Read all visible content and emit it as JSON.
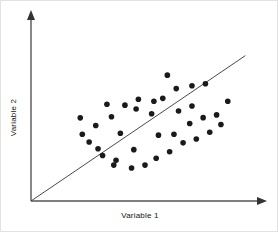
{
  "chart_data": {
    "type": "scatter",
    "title": "",
    "subtitle": "",
    "xlabel": "Variable 1",
    "ylabel": "Variable 2",
    "xlim": [
      0,
      100
    ],
    "ylim": [
      0,
      100
    ],
    "grid": false,
    "legend": null,
    "legend_position": "none",
    "axis_style": "arrow-axes-no-ticks",
    "tick_labels_x": [],
    "tick_labels_y": [],
    "annotations": [],
    "marker": {
      "shape": "circle",
      "color": "#1a1a1a",
      "radius_px": 2.8
    },
    "axis_color": "#555555",
    "trendline": {
      "label": "",
      "color": "#4a4a4a",
      "style": "solid",
      "x": [
        0,
        94
      ],
      "y": [
        0,
        79
      ]
    },
    "points": [
      {
        "x": 21.6,
        "y": 45.2
      },
      {
        "x": 28.4,
        "y": 41.0
      },
      {
        "x": 35.3,
        "y": 45.8
      },
      {
        "x": 25.5,
        "y": 32.1
      },
      {
        "x": 31.4,
        "y": 24.7
      },
      {
        "x": 37.3,
        "y": 22.1
      },
      {
        "x": 45.1,
        "y": 27.9
      },
      {
        "x": 50.0,
        "y": 19.5
      },
      {
        "x": 39.2,
        "y": 36.8
      },
      {
        "x": 46.1,
        "y": 50.0
      },
      {
        "x": 52.9,
        "y": 47.4
      },
      {
        "x": 57.8,
        "y": 55.8
      },
      {
        "x": 63.7,
        "y": 61.1
      },
      {
        "x": 70.6,
        "y": 62.6
      },
      {
        "x": 76.5,
        "y": 63.7
      },
      {
        "x": 59.8,
        "y": 68.4
      },
      {
        "x": 53.9,
        "y": 54.2
      },
      {
        "x": 47.1,
        "y": 55.3
      },
      {
        "x": 41.2,
        "y": 52.1
      },
      {
        "x": 33.3,
        "y": 52.6
      },
      {
        "x": 55.9,
        "y": 35.8
      },
      {
        "x": 62.7,
        "y": 36.3
      },
      {
        "x": 69.6,
        "y": 42.1
      },
      {
        "x": 75.5,
        "y": 45.3
      },
      {
        "x": 81.4,
        "y": 46.8
      },
      {
        "x": 86.3,
        "y": 54.2
      },
      {
        "x": 83.3,
        "y": 41.6
      },
      {
        "x": 78.4,
        "y": 37.4
      },
      {
        "x": 72.5,
        "y": 33.7
      },
      {
        "x": 66.7,
        "y": 31.6
      },
      {
        "x": 60.8,
        "y": 26.8
      },
      {
        "x": 54.9,
        "y": 23.2
      },
      {
        "x": 44.1,
        "y": 17.9
      },
      {
        "x": 36.3,
        "y": 19.5
      },
      {
        "x": 29.4,
        "y": 28.4
      },
      {
        "x": 22.5,
        "y": 36.3
      },
      {
        "x": 64.7,
        "y": 48.9
      },
      {
        "x": 70.6,
        "y": 51.6
      }
    ]
  }
}
